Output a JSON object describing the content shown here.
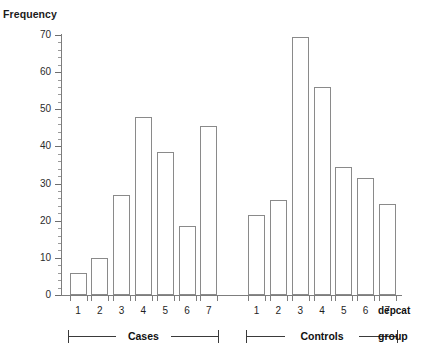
{
  "chart_data": {
    "type": "bar",
    "title": "",
    "xlabel": "depcat",
    "ylabel": "Frequency",
    "ylim": [
      0,
      70
    ],
    "ytick_step": 10,
    "yminor_step": 2,
    "grid": false,
    "legend": "none",
    "categories": [
      "1",
      "2",
      "3",
      "4",
      "5",
      "6",
      "7",
      "1",
      "2",
      "3",
      "4",
      "5",
      "6",
      "7"
    ],
    "ytick_labels": [
      "0",
      "10",
      "20",
      "30",
      "40",
      "50",
      "60",
      "70"
    ],
    "groups": [
      {
        "name": "Cases",
        "categories": [
          "1",
          "2",
          "3",
          "4",
          "5",
          "6",
          "7"
        ],
        "values": [
          6,
          10,
          27,
          48,
          38.5,
          18.7,
          45.5
        ]
      },
      {
        "name": "Controls",
        "categories": [
          "1",
          "2",
          "3",
          "4",
          "5",
          "6",
          "7"
        ],
        "values": [
          21.5,
          25.5,
          69.5,
          56,
          34.5,
          31.5,
          24.5
        ]
      }
    ],
    "values": [
      6,
      10,
      27,
      48,
      38.5,
      18.7,
      45.5,
      21.5,
      25.5,
      69.5,
      56,
      34.5,
      31.5,
      24.5
    ],
    "group_axis_label": "group",
    "bar_fill": "#ffffff",
    "bar_stroke": "#8a8a8a",
    "axis_color": "#7d7d7d",
    "text_color": "#1a1a1a"
  },
  "axis": {
    "y_title": "Frequency",
    "depcat_row_name": "depcat",
    "group_row_name": "group"
  }
}
